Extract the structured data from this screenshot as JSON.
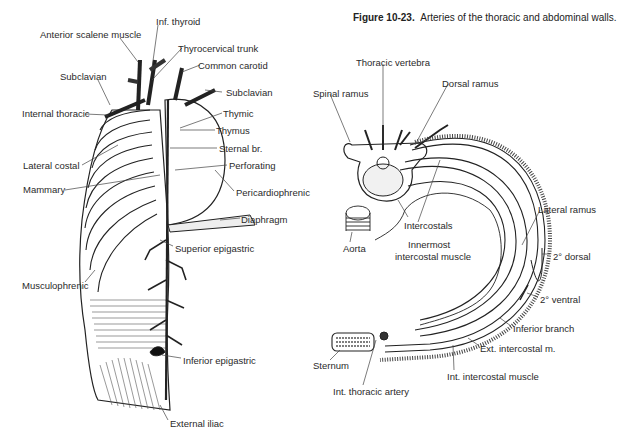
{
  "caption": {
    "figure_number": "Figure 10-23.",
    "text": "Arteries of the thoracic and abdominal walls."
  },
  "left_figure": {
    "labels": [
      {
        "id": "inf-thyroid",
        "text": "Inf. thyroid",
        "x": 156,
        "y": 16
      },
      {
        "id": "anterior-scalene",
        "text": "Anterior scalene muscle",
        "x": 40,
        "y": 29
      },
      {
        "id": "thyrocervical",
        "text": "Thyrocervical trunk",
        "x": 178,
        "y": 43
      },
      {
        "id": "common-carotid",
        "text": "Common carotid",
        "x": 198,
        "y": 60
      },
      {
        "id": "subclavian-left",
        "text": "Subclavian",
        "x": 60,
        "y": 71
      },
      {
        "id": "subclavian-right",
        "text": "Subclavian",
        "x": 226,
        "y": 87
      },
      {
        "id": "internal-thoracic",
        "text": "Internal thoracic",
        "x": 22,
        "y": 108
      },
      {
        "id": "thymic",
        "text": "Thymic",
        "x": 223,
        "y": 108
      },
      {
        "id": "thymus",
        "text": "Thymus",
        "x": 216,
        "y": 125
      },
      {
        "id": "sternal-br",
        "text": "Sternal br.",
        "x": 219,
        "y": 143
      },
      {
        "id": "lateral-costal",
        "text": "Lateral costal",
        "x": 23,
        "y": 160
      },
      {
        "id": "perforating",
        "text": "Perforating",
        "x": 229,
        "y": 160
      },
      {
        "id": "mammary",
        "text": "Mammary",
        "x": 23,
        "y": 184
      },
      {
        "id": "pericardiophrenic",
        "text": "Pericardiophrenic",
        "x": 236,
        "y": 187
      },
      {
        "id": "diaphragm",
        "text": "Diaphragm",
        "x": 241,
        "y": 214
      },
      {
        "id": "superior-epigastric",
        "text": "Superior epigastric",
        "x": 175,
        "y": 243
      },
      {
        "id": "musculophrenic",
        "text": "Musculophrenic",
        "x": 22,
        "y": 280
      },
      {
        "id": "inferior-epigastric",
        "text": "Inferior epigastric",
        "x": 183,
        "y": 355
      },
      {
        "id": "external-iliac",
        "text": "External iliac",
        "x": 170,
        "y": 418
      }
    ]
  },
  "right_figure": {
    "labels": [
      {
        "id": "thoracic-vertebra",
        "text": "Thoracic vertebra",
        "x": 356,
        "y": 57
      },
      {
        "id": "dorsal-ramus",
        "text": "Dorsal ramus",
        "x": 442,
        "y": 78
      },
      {
        "id": "spinal-ramus",
        "text": "Spinal ramus",
        "x": 313,
        "y": 88
      },
      {
        "id": "lateral-ramus",
        "text": "Lateral ramus",
        "x": 538,
        "y": 204
      },
      {
        "id": "intercostals",
        "text": "Intercostals",
        "x": 404,
        "y": 220
      },
      {
        "id": "aorta",
        "text": "Aorta",
        "x": 343,
        "y": 243
      },
      {
        "id": "innermost-intercostal-1",
        "text": "Innermost",
        "x": 408,
        "y": 239
      },
      {
        "id": "innermost-intercostal-2",
        "text": "intercostal muscle",
        "x": 395,
        "y": 251
      },
      {
        "id": "dorsal-2",
        "text": "2° dorsal",
        "x": 553,
        "y": 251
      },
      {
        "id": "ventral-2",
        "text": "2° ventral",
        "x": 540,
        "y": 294
      },
      {
        "id": "inferior-branch",
        "text": "Inferior branch",
        "x": 513,
        "y": 323
      },
      {
        "id": "ext-intercostal",
        "text": "Ext. intercostal m.",
        "x": 480,
        "y": 343
      },
      {
        "id": "sternum",
        "text": "Sternum",
        "x": 313,
        "y": 360
      },
      {
        "id": "int-intercostal",
        "text": "Int. intercostal muscle",
        "x": 447,
        "y": 371
      },
      {
        "id": "int-thoracic-artery",
        "text": "Int. thoracic artery",
        "x": 333,
        "y": 386
      }
    ]
  }
}
